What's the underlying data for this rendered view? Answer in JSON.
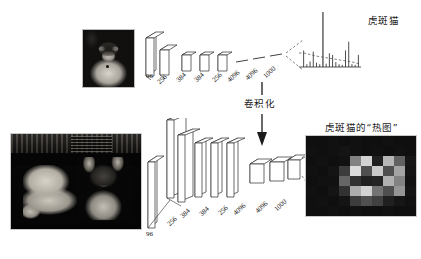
{
  "figure": {
    "title_top_right": "虎斑猫",
    "title_bottom_right": "虎斑猫的“热图”",
    "transform_label": "卷积化"
  },
  "top_network": {
    "input_label": "96",
    "layer_labels": [
      "256",
      "384",
      "384",
      "256",
      "4096",
      "4096",
      "1000"
    ]
  },
  "bottom_network": {
    "input_label": "96",
    "layer_labels": [
      "256",
      "384",
      "384",
      "256",
      "4096",
      "4096",
      "1000"
    ]
  },
  "images": {
    "top_photo_alt": "tabby-cat-photo",
    "bottom_photo_alt": "two-cats-photo",
    "heatmap_alt": "tabby-cat-heatmap"
  },
  "chart_data": {
    "type": "bar",
    "title": "虎斑猫",
    "xlabel": "",
    "ylabel": "",
    "grid": false,
    "legend": "none",
    "ylim": [
      0,
      1
    ],
    "categories": [
      "c1",
      "c2",
      "c3",
      "c4",
      "c5",
      "c6",
      "c7",
      "c8",
      "c9",
      "c10",
      "c11",
      "c12",
      "c13",
      "c14",
      "c15",
      "c16",
      "c17",
      "c18"
    ],
    "values": [
      0.3,
      0.05,
      0.1,
      0.28,
      0.08,
      0.05,
      1.0,
      0.06,
      0.25,
      0.22,
      0.09,
      0.05,
      0.04,
      0.3,
      0.46,
      0.05,
      0.04,
      0.22
    ]
  },
  "heatmap_data": {
    "type": "heatmap",
    "rows": 8,
    "cols": 10,
    "values": [
      [
        0.03,
        0.03,
        0.04,
        0.03,
        0.04,
        0.03,
        0.03,
        0.04,
        0.03,
        0.03
      ],
      [
        0.04,
        0.03,
        0.04,
        0.05,
        0.04,
        0.03,
        0.04,
        0.03,
        0.04,
        0.03
      ],
      [
        0.03,
        0.04,
        0.03,
        0.04,
        0.52,
        0.86,
        0.1,
        0.74,
        0.38,
        0.06
      ],
      [
        0.04,
        0.03,
        0.05,
        0.22,
        0.9,
        0.3,
        0.82,
        0.3,
        0.66,
        0.05
      ],
      [
        0.03,
        0.04,
        0.04,
        0.4,
        0.18,
        0.1,
        0.12,
        0.72,
        0.52,
        0.04
      ],
      [
        0.04,
        0.03,
        0.05,
        0.18,
        0.7,
        0.86,
        0.46,
        0.3,
        0.6,
        0.05
      ],
      [
        0.03,
        0.04,
        0.03,
        0.05,
        0.22,
        0.3,
        0.24,
        0.1,
        0.06,
        0.04
      ],
      [
        0.03,
        0.03,
        0.04,
        0.03,
        0.04,
        0.03,
        0.03,
        0.04,
        0.03,
        0.03
      ]
    ]
  },
  "colors": {
    "ink": "#1a1a1a",
    "line": "#2b2b2b",
    "bar": "#3a3a3a",
    "dashed": "#4a4a4a",
    "photo_bg": "#0a0a0a"
  }
}
